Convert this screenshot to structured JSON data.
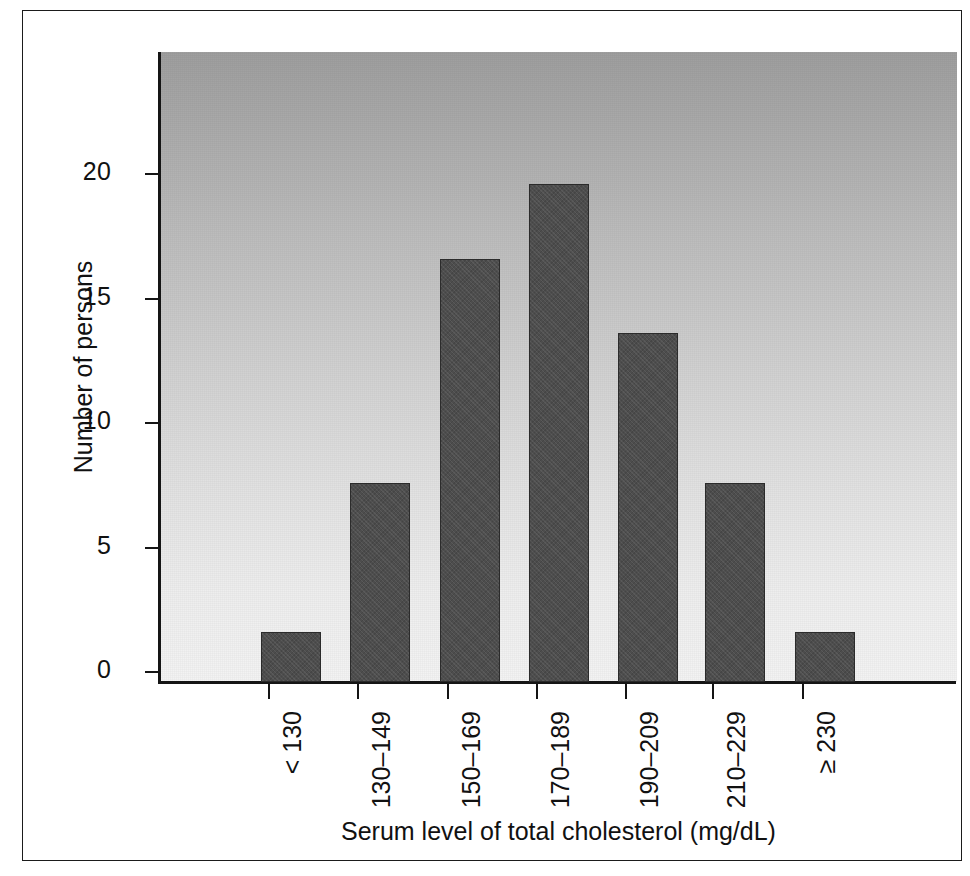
{
  "chart_data": {
    "type": "bar",
    "title": "",
    "subtitle": "",
    "xlabel": "Serum level of total cholesterol (mg/dL)",
    "ylabel": "Number of persons",
    "categories": [
      "< 130",
      "130–149",
      "150–169",
      "170–189",
      "190–209",
      "210–229",
      "≥ 230"
    ],
    "values": [
      2,
      8,
      17,
      20,
      14,
      8,
      2
    ],
    "ylim": [
      0,
      25.3
    ],
    "yticks": [
      0,
      5,
      10,
      15,
      20
    ],
    "ytick_labels": [
      "0",
      "5",
      "10",
      "15",
      "20"
    ],
    "grid": false,
    "legend": null,
    "legend_position": "none",
    "annotations": []
  },
  "style": {
    "bar_color": "#4d4d4d",
    "bar_edge_color": "#2b2b2b",
    "panel_gradient_top": "#9e9e9e",
    "panel_gradient_bottom": "#f3f3f3",
    "axis_color": "#151515",
    "frame_color": "#1b1b1b",
    "text_color": "#111111",
    "page_background": "#ffffff"
  },
  "geometry": {
    "plot_left": 137,
    "plot_top": 41,
    "plot_width": 797,
    "plot_height": 630,
    "baseline_y": 671,
    "px_per_unit": 24.9,
    "bar_width": 60,
    "bar_centers_x": [
      268,
      357,
      447,
      536,
      625,
      712,
      802
    ]
  }
}
